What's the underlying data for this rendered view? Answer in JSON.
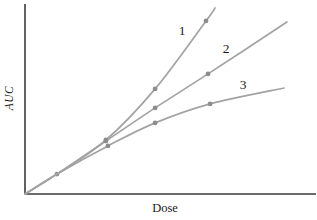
{
  "chart_data": {
    "type": "line",
    "title": "",
    "xlabel": "Dose",
    "ylabel": "AUC",
    "axes": {
      "x_ticks": [],
      "y_ticks": [],
      "note": "axes carry no tick marks or numeric labels; point coordinates below are percent of axis length measured from the origin"
    },
    "legend": "curves identified by numerals 1, 2, 3 printed beside them on the plot",
    "series": [
      {
        "name": "1",
        "label": "1",
        "label_pos": {
          "x": 54.0,
          "y": 86.3
        },
        "points": [
          {
            "x": 0,
            "y": 0
          },
          {
            "x": 11.0,
            "y": 10.5,
            "m": 1
          },
          {
            "x": 27.8,
            "y": 28.4,
            "m": 1
          },
          {
            "x": 44.7,
            "y": 55.3,
            "m": 1
          },
          {
            "x": 62.2,
            "y": 91.1,
            "m": 1
          },
          {
            "x": 65.3,
            "y": 97.9
          }
        ]
      },
      {
        "name": "2",
        "label": "2",
        "label_pos": {
          "x": 69.1,
          "y": 76.8
        },
        "points": [
          {
            "x": 0,
            "y": 0
          },
          {
            "x": 11.0,
            "y": 10.5
          },
          {
            "x": 27.8,
            "y": 27.9,
            "m": 1
          },
          {
            "x": 44.7,
            "y": 45.3,
            "m": 1
          },
          {
            "x": 62.9,
            "y": 63.2,
            "m": 1
          },
          {
            "x": 90.0,
            "y": 90.5
          }
        ]
      },
      {
        "name": "3",
        "label": "3",
        "label_pos": {
          "x": 74.9,
          "y": 57.9
        },
        "points": [
          {
            "x": 0,
            "y": 0
          },
          {
            "x": 11.0,
            "y": 10.5
          },
          {
            "x": 28.5,
            "y": 25.3,
            "m": 1
          },
          {
            "x": 44.7,
            "y": 37.4,
            "m": 1
          },
          {
            "x": 63.6,
            "y": 47.4,
            "m": 1
          },
          {
            "x": 89.0,
            "y": 55.8
          }
        ]
      }
    ],
    "colors": {
      "curve": "#a3a3a3",
      "marker": "#8c8c8c",
      "axis": "#3a3a3a",
      "text": "#1a1a1a",
      "background": "#ffffff"
    }
  }
}
